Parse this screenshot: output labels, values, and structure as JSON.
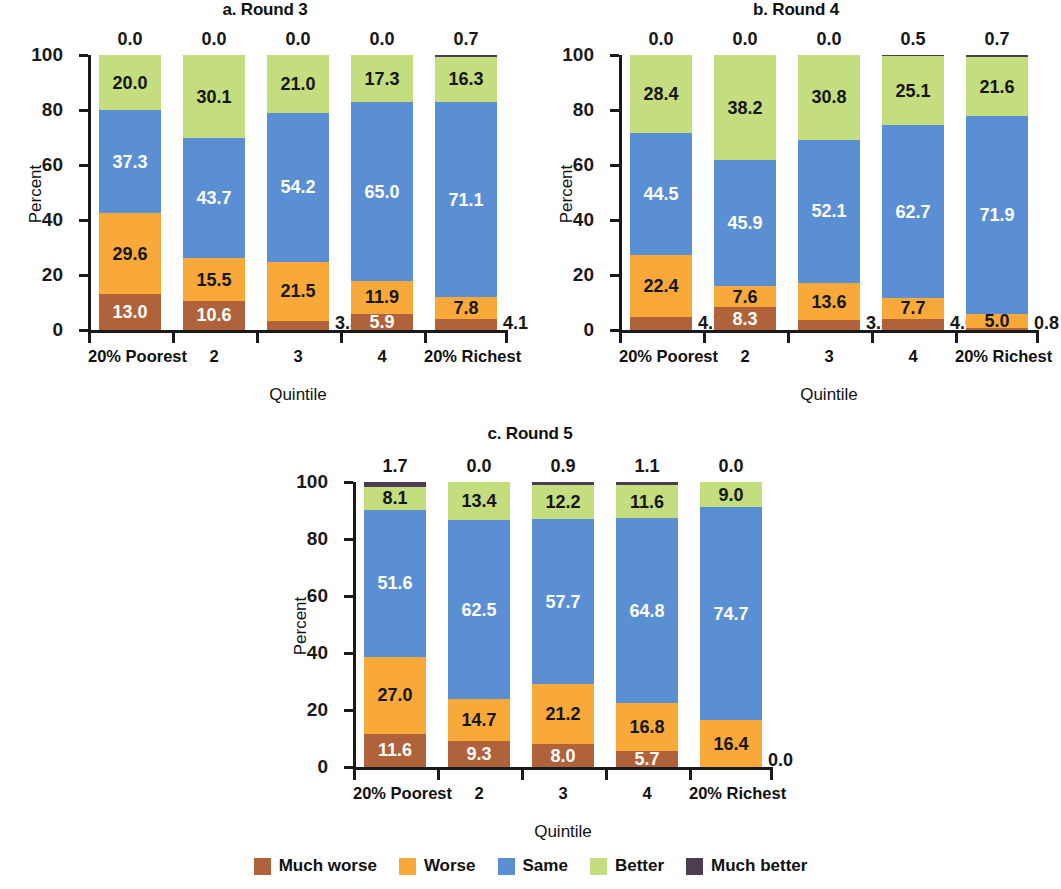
{
  "figure": {
    "categories": [
      "20% Poorest",
      "2",
      "3",
      "4",
      "20% Richest"
    ],
    "xlabel": "Quintile",
    "ylabel": "Percent",
    "ytick_labels": [
      "0",
      "20",
      "40",
      "60",
      "80",
      "100"
    ]
  },
  "legend": {
    "items": [
      {
        "label": "Much worse",
        "color": "#b0623a"
      },
      {
        "label": "Worse",
        "color": "#f8a93a"
      },
      {
        "label": "Same",
        "color": "#5b8fd4"
      },
      {
        "label": "Better",
        "color": "#c3dd7f"
      },
      {
        "label": "Much better",
        "color": "#4e3c52"
      }
    ]
  },
  "panels": [
    {
      "id": "a",
      "title": "a. Round 3"
    },
    {
      "id": "b",
      "title": "b. Round 4"
    },
    {
      "id": "c",
      "title": "c. Round 5"
    }
  ],
  "chart_data": [
    {
      "type": "bar",
      "subtype": "stacked-bar-100",
      "title": "a. Round 3",
      "xlabel": "Quintile",
      "ylabel": "Percent",
      "ylim": [
        0,
        100
      ],
      "yticks": [
        0,
        20,
        40,
        60,
        80,
        100
      ],
      "grid": false,
      "legend_position": "bottom-figure",
      "categories": [
        "20% Poorest",
        "2",
        "3",
        "4",
        "20% Richest"
      ],
      "series": [
        {
          "name": "Much worse",
          "color": "#b0623a",
          "values": [
            13.0,
            10.6,
            3.3,
            5.9,
            4.1
          ]
        },
        {
          "name": "Worse",
          "color": "#f8a93a",
          "values": [
            29.6,
            15.5,
            21.5,
            11.9,
            7.8
          ]
        },
        {
          "name": "Same",
          "color": "#5b8fd4",
          "values": [
            37.3,
            43.7,
            54.2,
            65.0,
            71.1
          ]
        },
        {
          "name": "Better",
          "color": "#c3dd7f",
          "values": [
            20.0,
            30.1,
            21.0,
            17.3,
            16.3
          ]
        },
        {
          "name": "Much better",
          "color": "#4e3c52",
          "values": [
            0.0,
            0.0,
            0.0,
            0.0,
            0.7
          ]
        }
      ]
    },
    {
      "type": "bar",
      "subtype": "stacked-bar-100",
      "title": "b. Round 4",
      "xlabel": "Quintile",
      "ylabel": "Percent",
      "ylim": [
        0,
        100
      ],
      "yticks": [
        0,
        20,
        40,
        60,
        80,
        100
      ],
      "grid": false,
      "legend_position": "bottom-figure",
      "categories": [
        "20% Poorest",
        "2",
        "3",
        "4",
        "20% Richest"
      ],
      "series": [
        {
          "name": "Much worse",
          "color": "#b0623a",
          "values": [
            4.7,
            8.3,
            3.5,
            4.0,
            0.8
          ]
        },
        {
          "name": "Worse",
          "color": "#f8a93a",
          "values": [
            22.4,
            7.6,
            13.6,
            7.7,
            5.0
          ]
        },
        {
          "name": "Same",
          "color": "#5b8fd4",
          "values": [
            44.5,
            45.9,
            52.1,
            62.7,
            71.9
          ]
        },
        {
          "name": "Better",
          "color": "#c3dd7f",
          "values": [
            28.4,
            38.2,
            30.8,
            25.1,
            21.6
          ]
        },
        {
          "name": "Much better",
          "color": "#4e3c52",
          "values": [
            0.0,
            0.0,
            0.0,
            0.5,
            0.7
          ]
        }
      ]
    },
    {
      "type": "bar",
      "subtype": "stacked-bar-100",
      "title": "c. Round 5",
      "xlabel": "Quintile",
      "ylabel": "Percent",
      "ylim": [
        0,
        100
      ],
      "yticks": [
        0,
        20,
        40,
        60,
        80,
        100
      ],
      "grid": false,
      "legend_position": "bottom-figure",
      "categories": [
        "20% Poorest",
        "2",
        "3",
        "4",
        "20% Richest"
      ],
      "series": [
        {
          "name": "Much worse",
          "color": "#b0623a",
          "values": [
            11.6,
            9.3,
            8.0,
            5.7,
            0.0
          ]
        },
        {
          "name": "Worse",
          "color": "#f8a93a",
          "values": [
            27.0,
            14.7,
            21.2,
            16.8,
            16.4
          ]
        },
        {
          "name": "Same",
          "color": "#5b8fd4",
          "values": [
            51.6,
            62.5,
            57.7,
            64.8,
            74.7
          ]
        },
        {
          "name": "Better",
          "color": "#c3dd7f",
          "values": [
            8.1,
            13.4,
            12.2,
            11.6,
            9.0
          ]
        },
        {
          "name": "Much better",
          "color": "#4e3c52",
          "values": [
            1.7,
            0.0,
            0.9,
            1.1,
            0.0
          ]
        }
      ]
    }
  ]
}
